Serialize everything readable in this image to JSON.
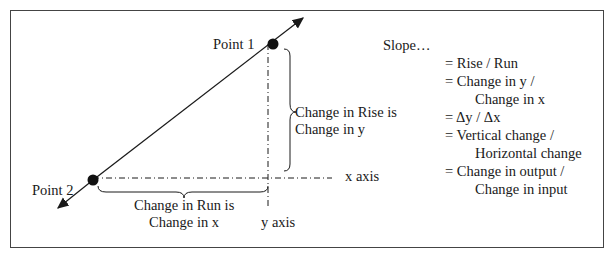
{
  "diagram": {
    "point1_label": "Point 1",
    "point2_label": "Point 2",
    "rise_label_line1": "Change in Rise is",
    "rise_label_line2": "Change in y",
    "run_label_line1": "Change in Run is",
    "run_label_line2": "Change in x",
    "x_axis_label": "x axis",
    "y_axis_label": "y axis"
  },
  "slope": {
    "title": "Slope…",
    "lines": [
      "= Rise / Run",
      "= Change in y /",
      "Change in x",
      "= Δy / Δx",
      "= Vertical change /",
      "Horizontal change",
      "= Change in output /",
      "Change in input"
    ]
  },
  "colors": {
    "line": "#1a1a1a",
    "border": "#444444"
  }
}
